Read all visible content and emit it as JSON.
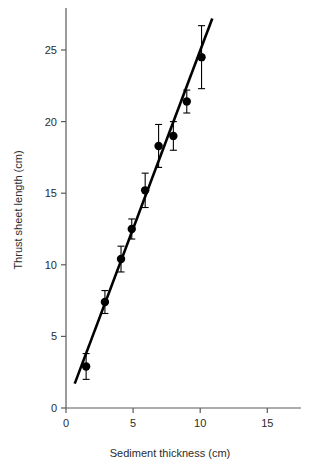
{
  "chart_data": {
    "type": "scatter",
    "title": "",
    "xlabel": "Sediment thickness (cm)",
    "ylabel": "Thrust sheet length (cm)",
    "xlim": [
      0,
      17.5
    ],
    "ylim": [
      0,
      28
    ],
    "xticks": [
      0,
      5,
      10,
      15
    ],
    "xtick_labels": [
      "0",
      "5",
      "10",
      "15"
    ],
    "yticks": [
      0,
      5,
      10,
      15,
      20,
      25
    ],
    "ytick_labels": [
      "0",
      "5",
      "10",
      "15",
      "20",
      "25"
    ],
    "grid": false,
    "legend": "none",
    "error_bars": "y",
    "marker": "filled-circle",
    "series": [
      {
        "name": "Thrust sheet length vs sediment thickness",
        "x": [
          1.5,
          2.9,
          4.1,
          4.9,
          5.9,
          6.9,
          8.0,
          9.0,
          10.1
        ],
        "y": [
          2.9,
          7.4,
          10.4,
          12.5,
          15.2,
          18.3,
          19.0,
          21.4,
          24.5
        ],
        "yerr": [
          0.9,
          0.8,
          0.9,
          0.7,
          1.2,
          1.5,
          1.0,
          0.8,
          2.2
        ]
      }
    ],
    "fit_line": {
      "name": "linear regression",
      "x_start": 0.65,
      "y_start": 1.7,
      "x_end": 10.9,
      "y_end": 27.2
    }
  }
}
